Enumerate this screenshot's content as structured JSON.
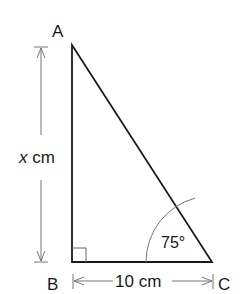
{
  "diagram": {
    "type": "right-triangle",
    "vertices": {
      "A": {
        "label": "A"
      },
      "B": {
        "label": "B"
      },
      "C": {
        "label": "C"
      }
    },
    "side_AB": {
      "label_var": "x",
      "label_unit": " cm"
    },
    "side_BC": {
      "label": "10 cm"
    },
    "angle_C": {
      "label": "75°"
    },
    "right_angle_at": "B",
    "colors": {
      "stroke": "#1a1a1a",
      "dimension": "#777777"
    }
  }
}
